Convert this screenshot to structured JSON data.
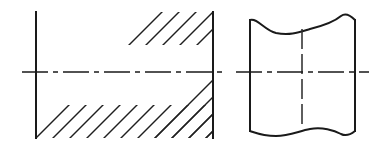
{
  "drawing": {
    "title": "Sectional view and broken view",
    "canvas": {
      "width": 372,
      "height": 150,
      "background": "#ffffff"
    },
    "colors": {
      "outline": "#1a1a1a",
      "hatch": "#1f1f1f",
      "centerline": "#1a1a1a",
      "background": "#ffffff"
    },
    "figures": [
      {
        "id": "sectional-view",
        "name": "Left figure: hatched sectional view",
        "bounds": {
          "left": 36,
          "right": 213,
          "top": 12,
          "bottom": 138
        },
        "edges": [
          {
            "name": "left-edge",
            "x": 36,
            "y1": 12,
            "y2": 138
          },
          {
            "name": "right-edge",
            "x": 213,
            "y1": 12,
            "y2": 138
          }
        ],
        "centerline": {
          "name": "horizontal-centerline",
          "y": 72,
          "x1": 22,
          "x2": 227,
          "style": "dash-dot"
        },
        "hatching": {
          "angle_degrees": 45,
          "direction": "up-to-the-right",
          "spacing": 17,
          "regions": [
            {
              "name": "top-band",
              "top": 12,
              "bottom": 45
            },
            {
              "name": "bottom-band",
              "top": 105,
              "bottom": 138
            },
            {
              "name": "right-wedge",
              "left": 150,
              "right": 213,
              "top": 12,
              "bottom": 138
            }
          ],
          "blank_region": {
            "name": "bore-middle-left",
            "left": 36,
            "right": 150,
            "top": 45,
            "bottom": 105
          }
        }
      },
      {
        "id": "broken-view",
        "name": "Right figure: broken view with wavy break lines",
        "bounds": {
          "left": 250,
          "right": 355,
          "top": 14,
          "bottom": 137
        },
        "edges": [
          {
            "name": "left-edge",
            "x": 250,
            "y1": 20,
            "y2": 131
          },
          {
            "name": "right-edge",
            "x": 355,
            "y1": 20,
            "y2": 131
          }
        ],
        "break_lines": [
          {
            "name": "top-break-line",
            "position": "top",
            "shape": "wavy"
          },
          {
            "name": "bottom-break-line",
            "position": "bottom",
            "shape": "wavy"
          }
        ],
        "centerline_horizontal": {
          "name": "horizontal-centerline",
          "y": 72,
          "x1": 236,
          "x2": 369,
          "style": "dash-dot"
        },
        "centerline_vertical": {
          "name": "vertical-centerline",
          "x": 302,
          "y1": 29,
          "y2": 125,
          "style": "dashed"
        }
      }
    ]
  }
}
